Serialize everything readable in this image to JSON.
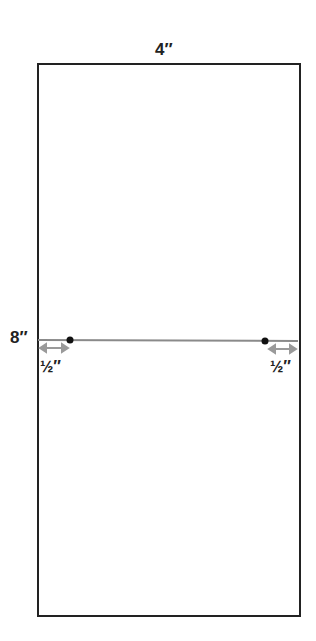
{
  "diagram": {
    "width_label": "4″",
    "height_label": "8″",
    "left_offset_label": "½″",
    "right_offset_label": "½″",
    "colors": {
      "outline": "#222222",
      "fold_line": "#8a8a8a",
      "arrow": "#9a9a9a",
      "dot": "#111111"
    }
  }
}
